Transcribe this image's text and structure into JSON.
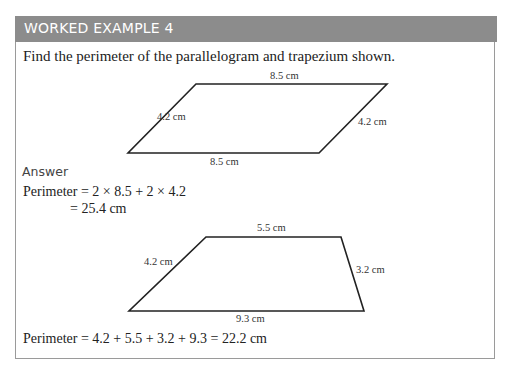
{
  "header": {
    "title": "WORKED EXAMPLE 4",
    "background_color": "#8c8c8c"
  },
  "question": "Find the perimeter of the parallelogram and trapezium shown.",
  "parallelogram": {
    "labels": {
      "top": "8.5 cm",
      "left": "4.2 cm",
      "right": "4.2 cm",
      "bottom": "8.5 cm"
    }
  },
  "answer": {
    "heading": "Answer",
    "line1": "Perimeter = 2 × 8.5 + 2 × 4.2",
    "line2": "= 25.4 cm"
  },
  "trapezium": {
    "labels": {
      "top": "5.5 cm",
      "left": "4.2 cm",
      "right": "3.2 cm",
      "bottom": "9.3 cm"
    }
  },
  "final": "Perimeter = 4.2 + 5.5 + 3.2 + 9.3 = 22.2 cm"
}
